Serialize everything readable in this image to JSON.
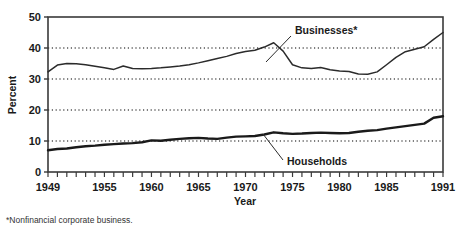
{
  "chart_data": {
    "type": "line",
    "title": "",
    "xlabel": "Year",
    "ylabel": "Percent",
    "xlim": [
      1949,
      1991
    ],
    "ylim": [
      0,
      50
    ],
    "grid": "horizontal-dotted",
    "legend": "inline-annotations",
    "ytick_labels": [
      "0",
      "10",
      "20",
      "30",
      "40",
      "50"
    ],
    "ytick_values": [
      0,
      10,
      20,
      30,
      40,
      50
    ],
    "xtick_labels": [
      "1949",
      "1955",
      "1960",
      "1965",
      "1970",
      "1975",
      "1980",
      "1985",
      "1991"
    ],
    "xtick_values": [
      1949,
      1955,
      1960,
      1965,
      1970,
      1975,
      1980,
      1985,
      1991
    ],
    "x": [
      1949,
      1950,
      1951,
      1952,
      1953,
      1954,
      1955,
      1956,
      1957,
      1958,
      1959,
      1960,
      1961,
      1962,
      1963,
      1964,
      1965,
      1966,
      1967,
      1968,
      1969,
      1970,
      1971,
      1972,
      1973,
      1974,
      1975,
      1976,
      1977,
      1978,
      1979,
      1980,
      1981,
      1982,
      1983,
      1984,
      1985,
      1986,
      1987,
      1988,
      1989,
      1990,
      1991
    ],
    "series": [
      {
        "name": "Businesses*",
        "label": "Businesses*",
        "annotation": "Businesses*",
        "values": [
          32.3,
          34.5,
          35.0,
          34.9,
          34.6,
          34.1,
          33.6,
          33.1,
          34.2,
          33.4,
          33.3,
          33.4,
          33.6,
          33.9,
          34.2,
          34.6,
          35.2,
          35.9,
          36.6,
          37.3,
          38.2,
          38.9,
          39.3,
          40.3,
          41.7,
          39.0,
          34.6,
          33.6,
          33.4,
          33.7,
          33.0,
          32.6,
          32.4,
          31.6,
          31.5,
          32.3,
          34.6,
          37.0,
          38.8,
          39.6,
          40.4,
          42.8,
          45.0
        ]
      },
      {
        "name": "Households",
        "label": "Households",
        "annotation": "Households",
        "values": [
          7.0,
          7.4,
          7.6,
          8.0,
          8.3,
          8.5,
          8.8,
          9.0,
          9.2,
          9.3,
          9.6,
          10.2,
          10.1,
          10.4,
          10.7,
          10.9,
          11.0,
          10.8,
          10.7,
          11.1,
          11.4,
          11.5,
          11.6,
          12.1,
          12.8,
          12.5,
          12.3,
          12.4,
          12.6,
          12.7,
          12.6,
          12.5,
          12.6,
          13.0,
          13.3,
          13.5,
          14.0,
          14.4,
          14.8,
          15.2,
          15.6,
          17.5,
          18.0
        ]
      }
    ],
    "footnote": "*Nonfinancial corporate business."
  }
}
